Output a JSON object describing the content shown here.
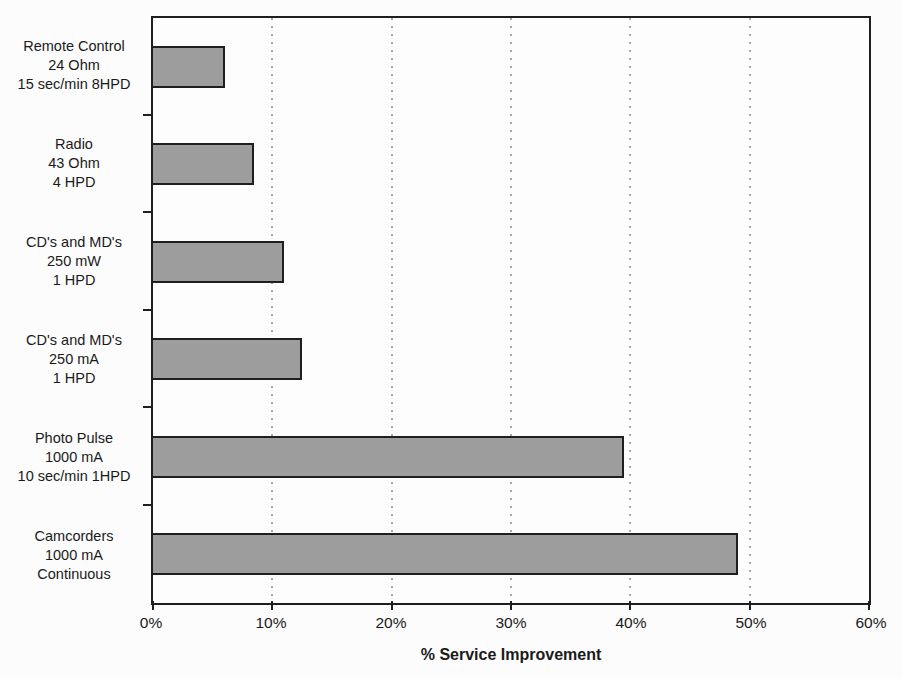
{
  "chart_data": {
    "type": "bar",
    "orientation": "horizontal",
    "title": "",
    "xlabel": "% Service Improvement",
    "xlim": [
      0,
      60
    ],
    "x_ticks": [
      "0%",
      "10%",
      "20%",
      "30%",
      "40%",
      "50%",
      "60%"
    ],
    "grid": "vertical dotted gridlines at each 10% tick",
    "legend": "none",
    "categories": [
      [
        "Remote Control",
        "24 Ohm",
        "15 sec/min 8HPD"
      ],
      [
        "Radio",
        "43 Ohm",
        "4 HPD"
      ],
      [
        "CD's and MD's",
        "250 mW",
        "1 HPD"
      ],
      [
        "CD's and MD's",
        "250 mA",
        "1 HPD"
      ],
      [
        "Photo Pulse",
        "1000 mA",
        "10 sec/min 1HPD"
      ],
      [
        "Camcorders",
        "1000 mA",
        "Continuous"
      ]
    ],
    "values": [
      6,
      8.5,
      11,
      12.5,
      39.5,
      49
    ],
    "colors": {
      "bar_fill": "#9d9d9d",
      "bar_border": "#1f1f1f",
      "plot_border": "#1f1f1f",
      "gridline": "#a8a8a8",
      "text": "#1a1a1a",
      "background": "#fcfcfc"
    }
  }
}
